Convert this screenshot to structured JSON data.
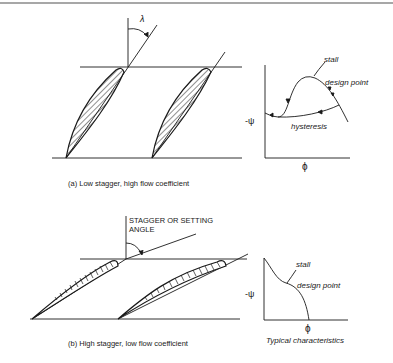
{
  "figure": {
    "panel_a": {
      "angle_symbol": "λ",
      "caption": "(a)  Low stagger, high flow coefficient",
      "chart": {
        "y_label": "-ψ",
        "x_label": "ϕ",
        "annotations": {
          "stall": "stall",
          "design_point": "design point",
          "hysteresis": "hysteresis"
        }
      }
    },
    "panel_b": {
      "angle_label_line1": "STAGGER OR SETTING",
      "angle_label_line2": "ANGLE",
      "caption": "(b)  High stagger, low flow coefficient",
      "chart": {
        "y_label": "-ψ",
        "x_label": "ϕ",
        "caption": "Typical characteristics",
        "annotations": {
          "stall": "stall",
          "design_point": "design point"
        }
      }
    }
  },
  "colors": {
    "ink": "#1a1a1a",
    "rule": "#8a8a8a"
  }
}
